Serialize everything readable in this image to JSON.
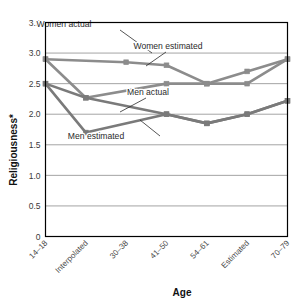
{
  "chart_data": {
    "type": "line",
    "title": "",
    "xlabel": "Age",
    "ylabel": "Religiousness*",
    "categories": [
      "14–18",
      "Interpolated",
      "30–38",
      "41–50",
      "54–61",
      "Estimated",
      "70–79"
    ],
    "ylim": [
      0,
      3.5
    ],
    "ytick_labels": [
      "0",
      "0.5",
      "1.0",
      "1.5",
      "2.0",
      "2.5",
      "3.0",
      "3.5"
    ],
    "ytick_values": [
      0,
      0.5,
      1.0,
      1.5,
      2.0,
      2.5,
      3.0,
      3.5
    ],
    "grid": true,
    "legend": "inline-annotations",
    "series": [
      {
        "name": "Women actual",
        "color": "#8c8c8c",
        "points": [
          {
            "x": "14–18",
            "y": 2.9
          },
          {
            "x": "30–38",
            "y": 2.85
          },
          {
            "x": "41–50",
            "y": 2.8
          },
          {
            "x": "54–61",
            "y": 2.5
          },
          {
            "x": "Estimated",
            "y": 2.5
          },
          {
            "x": "70–79",
            "y": 2.9
          }
        ]
      },
      {
        "name": "Women estimated",
        "color": "#8c8c8c",
        "points": [
          {
            "x": "14–18",
            "y": 2.9
          },
          {
            "x": "Interpolated",
            "y": 2.27
          },
          {
            "x": "41–50",
            "y": 2.5
          },
          {
            "x": "54–61",
            "y": 2.5
          },
          {
            "x": "Estimated",
            "y": 2.7
          },
          {
            "x": "70–79",
            "y": 2.9
          }
        ]
      },
      {
        "name": "Men actual",
        "color": "#7a7a7a",
        "points": [
          {
            "x": "14–18",
            "y": 2.5
          },
          {
            "x": "Interpolated",
            "y": 2.27
          },
          {
            "x": "41–50",
            "y": 2.0
          },
          {
            "x": "54–61",
            "y": 1.85
          },
          {
            "x": "Estimated",
            "y": 2.0
          },
          {
            "x": "70–79",
            "y": 2.22
          }
        ]
      },
      {
        "name": "Men estimated",
        "color": "#7a7a7a",
        "points": [
          {
            "x": "14–18",
            "y": 2.5
          },
          {
            "x": "Interpolated",
            "y": 1.7
          },
          {
            "x": "41–50",
            "y": 2.0
          },
          {
            "x": "54–61",
            "y": 1.85
          },
          {
            "x": "Estimated",
            "y": 2.0
          },
          {
            "x": "70–79",
            "y": 2.22
          }
        ]
      }
    ],
    "annotations": [
      {
        "label": "Women actual",
        "text_x": 64,
        "text_y": 27,
        "leader": [
          [
            120,
            30
          ],
          [
            152,
            53
          ]
        ]
      },
      {
        "label": "Women estimated",
        "text_x": 168,
        "text_y": 49,
        "leader": [
          [
            166,
            52
          ],
          [
            146,
            66
          ]
        ]
      },
      {
        "label": "Men actual",
        "text_x": 148,
        "text_y": 95,
        "leader": [
          [
            146,
            98
          ],
          [
            120,
            112
          ]
        ]
      },
      {
        "label": "Men estimated",
        "text_x": 96,
        "text_y": 139,
        "leader": [
          [
            160,
            136
          ],
          [
            140,
            120
          ]
        ]
      }
    ],
    "axis_colors": {
      "frame": "#000000",
      "grid": "#9a9a9a",
      "women_line": "#8c8c8c",
      "men_line": "#7a7a7a",
      "text": "#111111"
    }
  }
}
